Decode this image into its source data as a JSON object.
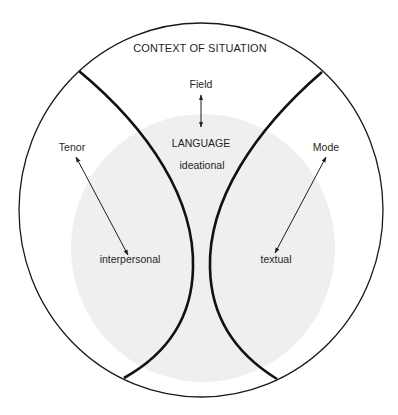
{
  "diagram": {
    "title": "CONTEXT OF SITUATION",
    "center_label": "LANGUAGE",
    "colors": {
      "background": "#ffffff",
      "outline": "#1a1a1a",
      "boundary": "#111111",
      "language_region": "#efefef",
      "text": "#1f1f1f"
    },
    "context_variables": [
      {
        "id": "field",
        "label": "Field",
        "metafunction": "ideational"
      },
      {
        "id": "tenor",
        "label": "Tenor",
        "metafunction": "interpersonal"
      },
      {
        "id": "mode",
        "label": "Mode",
        "metafunction": "textual"
      }
    ],
    "labels": {
      "field": "Field",
      "tenor": "Tenor",
      "mode": "Mode",
      "ideational": "ideational",
      "interpersonal": "interpersonal",
      "textual": "textual"
    },
    "relations": [
      {
        "from": "Field",
        "to": "ideational",
        "type": "double-arrow"
      },
      {
        "from": "Tenor",
        "to": "interpersonal",
        "type": "double-arrow"
      },
      {
        "from": "Mode",
        "to": "textual",
        "type": "double-arrow"
      }
    ]
  }
}
